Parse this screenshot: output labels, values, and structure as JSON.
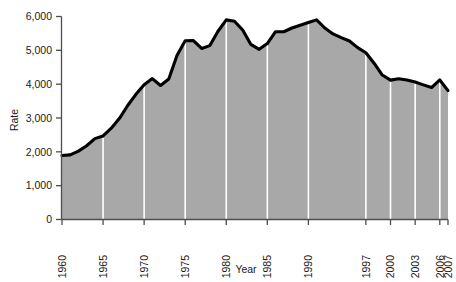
{
  "chart_data": {
    "type": "area",
    "title": "",
    "xlabel": "Year",
    "ylabel": "Rate",
    "xlim": [
      1960,
      2007
    ],
    "ylim": [
      0,
      6000
    ],
    "grid": "vertical-white-at-xticks",
    "legend": "none",
    "x_tick_labels": [
      "1960",
      "1965",
      "1970",
      "1975",
      "1980",
      "1985",
      "1990",
      "1997",
      "2000",
      "2003",
      "2006",
      "2007"
    ],
    "x_tick_values": [
      1960,
      1965,
      1970,
      1975,
      1980,
      1985,
      1990,
      1997,
      2000,
      2003,
      2006,
      2007
    ],
    "y_tick_labels": [
      "0",
      "1,000",
      "2,000",
      "3,000",
      "4,000",
      "5,000",
      "6,000"
    ],
    "y_tick_values": [
      0,
      1000,
      2000,
      3000,
      4000,
      5000,
      6000
    ],
    "x": [
      1960,
      1961,
      1962,
      1963,
      1964,
      1965,
      1966,
      1967,
      1968,
      1969,
      1970,
      1971,
      1972,
      1973,
      1974,
      1975,
      1976,
      1977,
      1978,
      1979,
      1980,
      1981,
      1982,
      1983,
      1984,
      1985,
      1986,
      1987,
      1988,
      1989,
      1990,
      1991,
      1992,
      1993,
      1994,
      1995,
      1996,
      1997,
      1998,
      1999,
      2000,
      2001,
      2002,
      2003,
      2004,
      2005,
      2006,
      2007
    ],
    "values": [
      1890,
      1910,
      2020,
      2180,
      2390,
      2470,
      2700,
      2990,
      3370,
      3700,
      3985,
      4165,
      3960,
      4150,
      4850,
      5285,
      5290,
      5055,
      5140,
      5565,
      5900,
      5860,
      5600,
      5175,
      5030,
      5200,
      5550,
      5550,
      5660,
      5740,
      5820,
      5900,
      5660,
      5485,
      5375,
      5275,
      5080,
      4930,
      4620,
      4270,
      4120,
      4160,
      4125,
      4065,
      3980,
      3900,
      4125,
      3810
    ],
    "series_color": "#000000",
    "area_fill_color": "#a8a8a8",
    "gridline_color": "#ffffff",
    "axis_color": "#4d4d4d",
    "peak_value": 5900,
    "peak_year": 1980,
    "start_value": 1890,
    "end_value": 3810
  }
}
